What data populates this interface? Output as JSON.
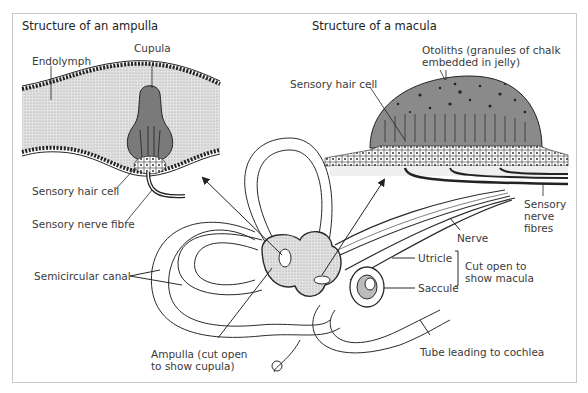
{
  "figure": {
    "panels": {
      "ampulla": {
        "title": "Structure of an ampulla",
        "labels": {
          "cupula": "Cupula",
          "endolymph": "Endolymph",
          "sensory_hair_cell": "Sensory hair cell",
          "sensory_nerve_fibre": "Sensory nerve fibre"
        }
      },
      "macula": {
        "title": "Structure of a macula",
        "labels": {
          "otoliths": "Otoliths (granules of chalk\nembedded in jelly)",
          "sensory_hair_cell": "Sensory hair cell",
          "sensory_nerve_fibres": "Sensory\nnerve\nfibres"
        }
      }
    },
    "main_labels": {
      "semicircular_canal": "Semicircular canal",
      "ampulla": "Ampulla (cut open\nto show cupula)",
      "nerve": "Nerve",
      "utricle": "Utricle",
      "saccule": "Saccule",
      "cut_open": "Cut open to\nshow macula",
      "tube_cochlea": "Tube leading to cochlea"
    },
    "colors": {
      "frame": "#c8c8c8",
      "line": "#2a2a2a",
      "endolymph_fill": "#d9d9d9",
      "cupula_fill": "#7a7a7a",
      "otolith_fill": "#8a8a8a",
      "label_text": "#3a3a3a"
    }
  }
}
